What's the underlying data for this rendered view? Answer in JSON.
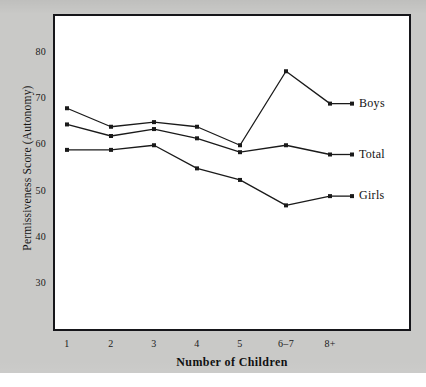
{
  "chart_data": {
    "type": "line",
    "title": "",
    "xlabel": "Number of Children",
    "ylabel": "Permissiveness Score (Autonomy)",
    "categories": [
      "1",
      "2",
      "3",
      "4",
      "5",
      "6–7",
      "8+"
    ],
    "ylim": [
      25,
      85
    ],
    "yticks": [
      30,
      40,
      50,
      60,
      70,
      80
    ],
    "ytick_labels": [
      "30",
      "40",
      "50",
      "60",
      "70",
      "80"
    ],
    "grid": false,
    "legend_position": "right-inline-end-of-line",
    "series": [
      {
        "name": "Boys",
        "values": [
          68,
          64,
          65,
          64,
          60,
          76,
          69
        ],
        "color": "#1a1a1a",
        "marker": "filled-square"
      },
      {
        "name": "Total",
        "values": [
          64.5,
          62,
          63.5,
          61.5,
          58.5,
          60,
          58
        ],
        "color": "#1a1a1a",
        "marker": "filled-square"
      },
      {
        "name": "Girls",
        "values": [
          59,
          59,
          60,
          55,
          52.5,
          47,
          49
        ],
        "color": "#1a1a1a",
        "marker": "filled-square"
      }
    ]
  },
  "figure": {
    "background_color": "#c9c9c7",
    "plot_background_color": "#ffffff",
    "frame_color": "#16161a"
  }
}
